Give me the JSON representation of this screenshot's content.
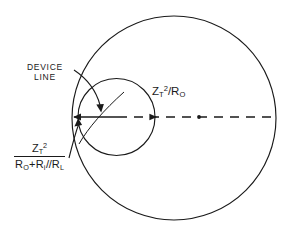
{
  "diagram": {
    "title_present": false,
    "background_color": "#ffffff",
    "stroke_color": "#1a1a1a",
    "labels": {
      "device_line": {
        "line1": "DEVICE",
        "line2": "LINE"
      },
      "big_circle_expression": {
        "base": "Z",
        "subscript": "T",
        "superscript": "2",
        "divider": "/",
        "denominator_base": "R",
        "denominator_subscript": "O",
        "full_text": "Z_T^2/R_O"
      },
      "fraction_expression": {
        "numerator": {
          "base": "Z",
          "subscript": "T",
          "superscript": "2"
        },
        "denominator_parts": [
          {
            "base": "R",
            "subscript": "O"
          },
          {
            "operator": "+"
          },
          {
            "base": "R",
            "subscript": "i"
          },
          {
            "operator": "//"
          },
          {
            "base": "R",
            "subscript": "L"
          }
        ],
        "full_text": "Z_T^2 / (R_O + R_i // R_L)"
      }
    },
    "geometry": {
      "large_circle": {
        "cx": 174,
        "cy": 118,
        "r": 102
      },
      "small_circle": {
        "cx": 116.5,
        "cy": 117,
        "r": 38.5
      },
      "axis": {
        "y": 117,
        "x_start": 72,
        "x_end": 276,
        "style": "dashed",
        "solid_lead_end": 116,
        "center_dot_x": 199,
        "center_dot_r": 1.8
      },
      "arrowheads": [
        {
          "name": "axis-left-arrow",
          "x": 76,
          "y": 117,
          "direction": "left"
        },
        {
          "name": "axis-mid-arrow",
          "x": 155,
          "y": 117,
          "direction": "right"
        },
        {
          "name": "device-line-arrow",
          "x": 100,
          "y": 110,
          "direction": "down-right"
        },
        {
          "name": "fraction-leader-arrow",
          "x": 79,
          "y": 120,
          "direction": "up-right"
        }
      ]
    }
  }
}
